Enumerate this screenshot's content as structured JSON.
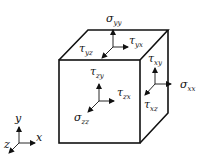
{
  "diagram": {
    "colors": {
      "stroke": "#111111",
      "background": "#ffffff"
    },
    "labels": {
      "sigma_yy": {
        "symbol": "σ",
        "sub": "yy"
      },
      "tau_yx": {
        "symbol": "τ",
        "sub": "yx"
      },
      "tau_yz": {
        "symbol": "τ",
        "sub": "yz"
      },
      "tau_xy": {
        "symbol": "τ",
        "sub": "xy"
      },
      "sigma_xx": {
        "symbol": "σ",
        "sub": "xx"
      },
      "tau_xz": {
        "symbol": "τ",
        "sub": "xz"
      },
      "tau_zy": {
        "symbol": "τ",
        "sub": "zy"
      },
      "tau_zx": {
        "symbol": "τ",
        "sub": "zx"
      },
      "sigma_zz": {
        "symbol": "σ",
        "sub": "zz"
      }
    },
    "axes": {
      "x": "x",
      "y": "y",
      "z": "z"
    }
  }
}
